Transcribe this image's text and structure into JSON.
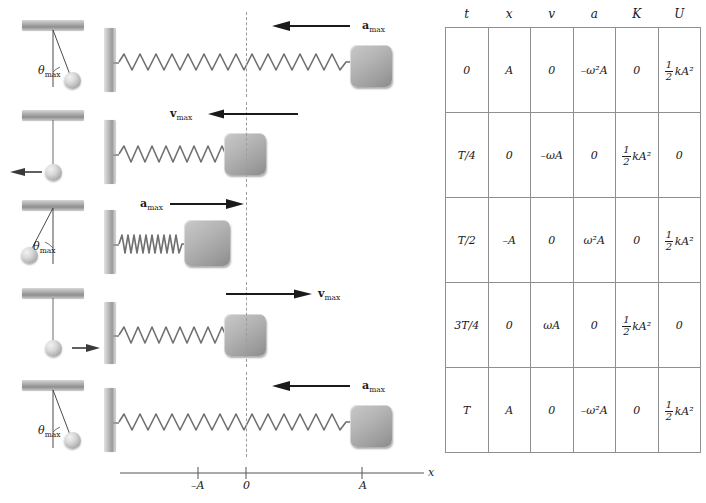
{
  "figure": {
    "axis": {
      "label": "x",
      "ticks": [
        {
          "text": "–A",
          "value": -1
        },
        {
          "text": "0",
          "value": 0
        },
        {
          "text": "A",
          "value": 1
        }
      ]
    },
    "rows": [
      {
        "time": "0",
        "pendulum": {
          "state": "displaced-right",
          "angle_label": "θ",
          "angle_sub": "max",
          "arrow": "none"
        },
        "spring": {
          "position": "A",
          "spring_state": "stretched",
          "arrow_label": "a",
          "arrow_sub": "max",
          "arrow_dir": "left",
          "arrow_type": "acceleration"
        }
      },
      {
        "time": "T/4",
        "pendulum": {
          "state": "vertical",
          "angle_label": "",
          "angle_sub": "",
          "arrow": "left"
        },
        "spring": {
          "position": "0",
          "spring_state": "natural",
          "arrow_label": "v",
          "arrow_sub": "max",
          "arrow_dir": "left",
          "arrow_type": "velocity"
        }
      },
      {
        "time": "T/2",
        "pendulum": {
          "state": "displaced-left",
          "angle_label": "θ",
          "angle_sub": "max",
          "arrow": "none"
        },
        "spring": {
          "position": "–A",
          "spring_state": "compressed",
          "arrow_label": "a",
          "arrow_sub": "max",
          "arrow_dir": "right",
          "arrow_type": "acceleration"
        }
      },
      {
        "time": "3T/4",
        "pendulum": {
          "state": "vertical",
          "angle_label": "",
          "angle_sub": "",
          "arrow": "right"
        },
        "spring": {
          "position": "0",
          "spring_state": "natural",
          "arrow_label": "v",
          "arrow_sub": "max",
          "arrow_dir": "right",
          "arrow_type": "velocity"
        }
      },
      {
        "time": "T",
        "pendulum": {
          "state": "displaced-right",
          "angle_label": "θ",
          "angle_sub": "max",
          "arrow": "none"
        },
        "spring": {
          "position": "A",
          "spring_state": "stretched",
          "arrow_label": "a",
          "arrow_sub": "max",
          "arrow_dir": "left",
          "arrow_type": "acceleration"
        }
      }
    ]
  },
  "table": {
    "headers": [
      "t",
      "x",
      "v",
      "a",
      "K",
      "U"
    ],
    "rows": [
      {
        "t": {
          "kind": "text",
          "text": "T",
          "prefix": "",
          "value": "0"
        },
        "x": {
          "kind": "text",
          "value": "A"
        },
        "v": {
          "kind": "text",
          "value": "0"
        },
        "a": {
          "kind": "omega2",
          "sign": "–",
          "value": "–ω²A"
        },
        "K": {
          "kind": "text",
          "value": "0"
        },
        "U": {
          "kind": "frac",
          "num": "1",
          "den": "2",
          "tail": "kA²",
          "value": "½ kA²"
        }
      },
      {
        "t": {
          "kind": "text",
          "value": "T/4"
        },
        "x": {
          "kind": "text",
          "value": "0"
        },
        "v": {
          "kind": "text",
          "value": "–ωA"
        },
        "a": {
          "kind": "text",
          "value": "0"
        },
        "K": {
          "kind": "frac",
          "num": "1",
          "den": "2",
          "tail": "kA²",
          "value": "½ kA²"
        },
        "U": {
          "kind": "text",
          "value": "0"
        }
      },
      {
        "t": {
          "kind": "text",
          "value": "T/2"
        },
        "x": {
          "kind": "text",
          "value": "–A"
        },
        "v": {
          "kind": "text",
          "value": "0"
        },
        "a": {
          "kind": "omega2",
          "sign": "",
          "value": "ω²A"
        },
        "K": {
          "kind": "text",
          "value": "0"
        },
        "U": {
          "kind": "frac",
          "num": "1",
          "den": "2",
          "tail": "kA²",
          "value": "½ kA²"
        }
      },
      {
        "t": {
          "kind": "text",
          "value": "3T/4"
        },
        "x": {
          "kind": "text",
          "value": "0"
        },
        "v": {
          "kind": "text",
          "value": "ωA"
        },
        "a": {
          "kind": "text",
          "value": "0"
        },
        "K": {
          "kind": "frac",
          "num": "1",
          "den": "2",
          "tail": "kA²",
          "value": "½ kA²"
        },
        "U": {
          "kind": "text",
          "value": "0"
        }
      },
      {
        "t": {
          "kind": "text",
          "value": "T"
        },
        "x": {
          "kind": "text",
          "value": "A"
        },
        "v": {
          "kind": "text",
          "value": "0"
        },
        "a": {
          "kind": "omega2",
          "sign": "–",
          "value": "–ω²A"
        },
        "K": {
          "kind": "text",
          "value": "0"
        },
        "U": {
          "kind": "frac",
          "num": "1",
          "den": "2",
          "tail": "kA²",
          "value": "½ kA²"
        }
      }
    ]
  },
  "colors": {
    "ink": "#1a1a1a",
    "metal": "#b4b4b4",
    "rule": "#8f8f8f",
    "dash": "#9b9b9b"
  }
}
